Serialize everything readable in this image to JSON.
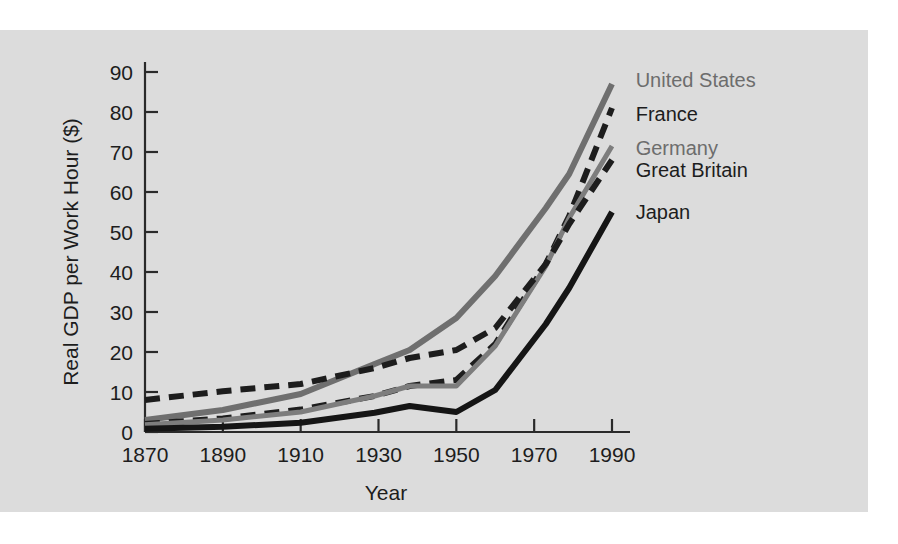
{
  "figure": {
    "panel_background": "#dcdcdc",
    "page_background": "#ffffff"
  },
  "chart_data": {
    "type": "line",
    "title": "",
    "subtitle": "",
    "xlabel": "Year",
    "ylabel": "Real GDP per Work Hour ($)",
    "xlim": [
      1870,
      1995
    ],
    "ylim": [
      0,
      93
    ],
    "xticks": [
      1870,
      1890,
      1910,
      1930,
      1950,
      1970,
      1990
    ],
    "xtick_labels": [
      "1870",
      "1890",
      "1910",
      "1930",
      "1950",
      "1970",
      "1990"
    ],
    "yticks": [
      0,
      10,
      20,
      30,
      40,
      50,
      60,
      70,
      80,
      90
    ],
    "ytick_labels": [
      "0",
      "10",
      "20",
      "30",
      "40",
      "50",
      "60",
      "70",
      "80",
      "90"
    ],
    "grid": false,
    "legend_position": "right-inline-labels",
    "x": [
      1870,
      1890,
      1910,
      1929,
      1938,
      1950,
      1960,
      1973,
      1979,
      1990
    ],
    "series": [
      {
        "name": "United States",
        "label": "United States",
        "color": "#6f6f6f",
        "style": "solid",
        "width": 6,
        "values": [
          3.0,
          5.5,
          9.5,
          17.0,
          20.5,
          28.5,
          39.0,
          56.0,
          64.5,
          87.0
        ],
        "label_x": 1993,
        "label_y": 88.0
      },
      {
        "name": "France",
        "label": "France",
        "color": "#1d1d1d",
        "style": "dashed",
        "width": 6,
        "values": [
          2.0,
          3.4,
          5.6,
          9.0,
          11.5,
          13.0,
          22.0,
          42.0,
          54.0,
          81.0
        ],
        "label_x": 1993,
        "label_y": 79.5
      },
      {
        "name": "Germany",
        "label": "Germany",
        "color": "#7d7d7d",
        "style": "solid",
        "width": 5,
        "values": [
          1.8,
          3.0,
          5.0,
          9.0,
          11.5,
          11.5,
          21.5,
          41.5,
          53.5,
          71.5
        ],
        "label_x": 1993,
        "label_y": 71.0
      },
      {
        "name": "Great Britain",
        "label": "Great Britain",
        "color": "#1d1d1d",
        "style": "dashed",
        "width": 6,
        "values": [
          8.0,
          10.2,
          12.0,
          16.0,
          18.5,
          20.5,
          26.0,
          42.0,
          52.0,
          68.0
        ],
        "label_x": 1993,
        "label_y": 65.5
      },
      {
        "name": "Japan",
        "label": "Japan",
        "color": "#151515",
        "style": "solid",
        "width": 6,
        "values": [
          0.8,
          1.3,
          2.3,
          4.8,
          6.5,
          5.0,
          10.5,
          27.0,
          36.0,
          55.0
        ],
        "label_x": 1993,
        "label_y": 55.0
      }
    ]
  }
}
